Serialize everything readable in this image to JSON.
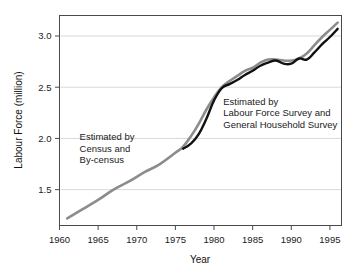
{
  "chart_data": {
    "type": "line",
    "title": "",
    "xlabel": "Year",
    "ylabel": "Labour Force (million)",
    "xlim": [
      1960,
      1996.5
    ],
    "ylim": [
      1.15,
      3.2
    ],
    "xticks": [
      1960,
      1965,
      1970,
      1975,
      1980,
      1985,
      1990,
      1995
    ],
    "xticklabels": [
      "1960",
      "1965",
      "1970",
      "1975",
      "1980",
      "1985",
      "1990",
      "1995"
    ],
    "yticks": [
      1.5,
      2.0,
      2.5,
      3.0
    ],
    "yticklabels": [
      "1.5",
      "2.0",
      "2.5",
      "3.0"
    ],
    "grid": "horizontal",
    "legend": "none",
    "series": [
      {
        "name": "Estimated by Census and By-census",
        "color": "#8c8c8c",
        "linewidth": 2.6,
        "x": [
          1961,
          1963,
          1965,
          1967,
          1969,
          1971,
          1973,
          1975,
          1976,
          1977,
          1978,
          1979,
          1980,
          1981,
          1982,
          1983,
          1984,
          1985,
          1986,
          1987,
          1988,
          1989,
          1990,
          1991,
          1992,
          1993,
          1994,
          1995,
          1996
        ],
        "values": [
          1.22,
          1.31,
          1.4,
          1.5,
          1.58,
          1.67,
          1.75,
          1.86,
          1.92,
          2.02,
          2.14,
          2.28,
          2.4,
          2.5,
          2.56,
          2.61,
          2.66,
          2.69,
          2.74,
          2.77,
          2.77,
          2.76,
          2.76,
          2.78,
          2.83,
          2.91,
          2.99,
          3.06,
          3.13
        ]
      },
      {
        "name": "Estimated by Labour Force Survey and General Household Survey",
        "color": "#111111",
        "linewidth": 2.4,
        "x": [
          1976,
          1977,
          1978,
          1979,
          1980,
          1981,
          1982,
          1983,
          1984,
          1985,
          1986,
          1987,
          1988,
          1989,
          1990,
          1991,
          1992,
          1993,
          1994,
          1995,
          1996
        ],
        "values": [
          1.9,
          1.95,
          2.04,
          2.19,
          2.37,
          2.49,
          2.53,
          2.57,
          2.62,
          2.66,
          2.71,
          2.74,
          2.76,
          2.73,
          2.73,
          2.78,
          2.77,
          2.84,
          2.92,
          2.99,
          3.07
        ]
      }
    ],
    "annotations": [
      {
        "id": "annotation-census",
        "lines": [
          "Estimated by",
          "Census and",
          "By-census"
        ],
        "x": 1962.6,
        "y": 1.98
      },
      {
        "id": "annotation-survey",
        "lines": [
          "Estimated by",
          "Labour Force Survey and",
          "General Household Survey"
        ],
        "x": 1981.2,
        "y": 2.33
      }
    ]
  },
  "axes": {
    "y_axis_title": "Labour Force (million)",
    "x_axis_title": "Year"
  },
  "colors": {
    "census_series": "#8c8c8c",
    "survey_series": "#111111",
    "grid": "#d9d9d9",
    "frame": "#4a4a4a",
    "background": "#ffffff"
  }
}
